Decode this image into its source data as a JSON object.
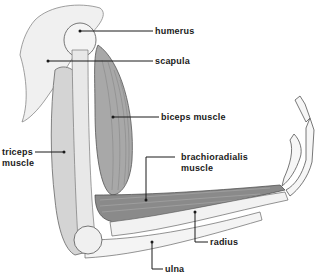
{
  "diagram": {
    "labels": [
      {
        "id": "humerus",
        "text": "humerus"
      },
      {
        "id": "scapula",
        "text": "scapula"
      },
      {
        "id": "biceps",
        "text": "biceps muscle"
      },
      {
        "id": "triceps_1",
        "text": "triceps"
      },
      {
        "id": "triceps_2",
        "text": "muscle"
      },
      {
        "id": "brachio_1",
        "text": "brachioradialis"
      },
      {
        "id": "brachio_2",
        "text": "muscle"
      },
      {
        "id": "radius",
        "text": "radius"
      },
      {
        "id": "ulna",
        "text": "ulna"
      }
    ],
    "colors": {
      "background": "#ffffff",
      "ink": "#1a1a1a",
      "bone": "#ececec",
      "muscle": "#9a9a9a"
    }
  }
}
